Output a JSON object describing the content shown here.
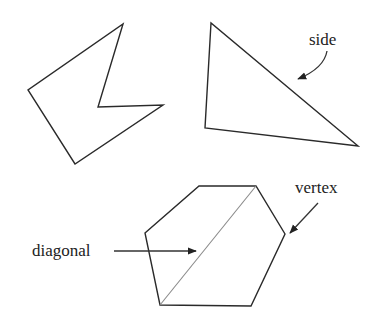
{
  "diagram": {
    "type": "polygon-terminology",
    "stroke_color": "#2a2a2a",
    "diagonal_color": "#8a8a8a",
    "background": "#ffffff",
    "shapes": [
      {
        "name": "concave-pentagon",
        "points": "123,24 98,107 163,105 75,164 28,90"
      },
      {
        "name": "triangle",
        "points": "211,23 205,128 358,146"
      },
      {
        "name": "hexagon",
        "points": "199,186 256,186 285,234 251,306 160,305 145,233"
      }
    ],
    "diagonal": {
      "x1": 256,
      "y1": 186,
      "x2": 160,
      "y2": 305
    },
    "labels": {
      "side": "side",
      "vertex": "vertex",
      "diagonal": "diagonal"
    }
  }
}
